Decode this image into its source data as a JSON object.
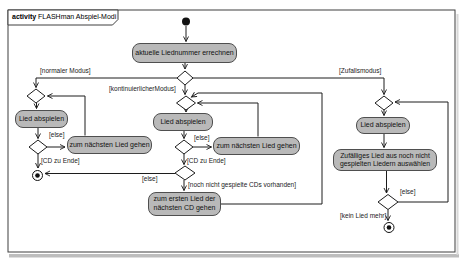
{
  "frame": {
    "keyword": "activity",
    "title": "FLASHman Abspiel-Modi"
  },
  "actions": {
    "calc": "aktuelle Liednummer errechnen",
    "left_play": "Lied abspielen",
    "left_next": "zum nächsten Lied gehen",
    "mid_play": "Lied abspielen",
    "mid_next": "zum nächsten Lied gehen",
    "mid_first_cd": [
      "zum ersten Lied der",
      "nächsten CD gehen"
    ],
    "right_play": "Lied abspielen",
    "right_random": [
      "Zufälliges Lied aus noch nicht",
      "gespielten Liedern auswählen"
    ]
  },
  "guards": {
    "normal_mode": "[normaler Modus]",
    "continuous_mode": "[kontinuierlicherModus]",
    "random_mode": "[Zufallsmodus]",
    "left_else": "[else]",
    "left_cd_end": "[CD zu Ende]",
    "mid_else_next": "[else]",
    "mid_cd_end": "[CD zu Ende]",
    "mid_else_final": "[else]",
    "mid_cds_available": "[noch nicht gespielte CDs vorhanden]",
    "right_else": "[else]",
    "right_no_song": "[kein Lied mehr]"
  },
  "colors": {
    "action-fill": "#b9b9b9",
    "action-stroke": "#4f4f4f",
    "line": "#1c1c1c",
    "frame": "#3f3f3f",
    "bg": "#ffffff",
    "shadow": "#bdbdbd"
  }
}
